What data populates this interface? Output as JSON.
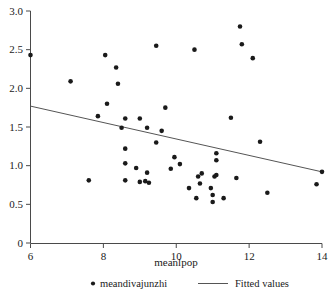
{
  "chart_data": {
    "type": "scatter",
    "title": "",
    "xlabel": "meanlpop",
    "ylabel": "",
    "xlim": [
      6,
      14
    ],
    "ylim": [
      0,
      3.0
    ],
    "grid": false,
    "xticks": [
      "6",
      "8",
      "10",
      "12",
      "14"
    ],
    "xtick_values": [
      6,
      8,
      10,
      12,
      14
    ],
    "yticks": [
      "0",
      "0.5",
      "1.0",
      "1.5",
      "2.0",
      "2.5",
      "3.0"
    ],
    "ytick_values": [
      0,
      0.5,
      1.0,
      1.5,
      2.0,
      2.5,
      3.0
    ],
    "legend_position": "below-axis",
    "series": [
      {
        "name": "meandivajunzhi",
        "type": "scatter",
        "marker": "circle",
        "color": "#1a1a1a",
        "points": [
          [
            6.0,
            2.43
          ],
          [
            7.1,
            2.09
          ],
          [
            7.6,
            0.81
          ],
          [
            7.85,
            1.64
          ],
          [
            8.05,
            2.43
          ],
          [
            8.1,
            1.8
          ],
          [
            8.35,
            2.27
          ],
          [
            8.4,
            2.06
          ],
          [
            8.5,
            1.49
          ],
          [
            8.6,
            1.61
          ],
          [
            8.6,
            1.22
          ],
          [
            8.6,
            1.03
          ],
          [
            8.6,
            0.81
          ],
          [
            8.9,
            0.97
          ],
          [
            9.0,
            1.61
          ],
          [
            9.0,
            0.79
          ],
          [
            9.15,
            0.8
          ],
          [
            9.2,
            1.49
          ],
          [
            9.2,
            0.91
          ],
          [
            9.25,
            0.78
          ],
          [
            9.45,
            2.55
          ],
          [
            9.45,
            1.3
          ],
          [
            9.6,
            1.45
          ],
          [
            9.7,
            1.75
          ],
          [
            9.85,
            0.96
          ],
          [
            9.95,
            1.11
          ],
          [
            10.1,
            1.02
          ],
          [
            10.35,
            0.71
          ],
          [
            10.5,
            2.5
          ],
          [
            10.55,
            0.58
          ],
          [
            10.6,
            0.86
          ],
          [
            10.65,
            0.77
          ],
          [
            10.7,
            0.9
          ],
          [
            10.95,
            0.71
          ],
          [
            11.0,
            0.62
          ],
          [
            11.0,
            0.53
          ],
          [
            11.05,
            0.86
          ],
          [
            11.1,
            1.16
          ],
          [
            11.1,
            1.07
          ],
          [
            11.1,
            0.88
          ],
          [
            11.3,
            0.58
          ],
          [
            11.5,
            1.62
          ],
          [
            11.65,
            0.84
          ],
          [
            11.75,
            2.8
          ],
          [
            11.8,
            2.57
          ],
          [
            12.1,
            2.39
          ],
          [
            12.3,
            1.31
          ],
          [
            12.5,
            0.65
          ],
          [
            13.85,
            0.76
          ],
          [
            14.0,
            0.92
          ]
        ]
      },
      {
        "name": "Fitted values",
        "type": "line",
        "color": "#555555",
        "endpoints": [
          [
            6.0,
            1.77
          ],
          [
            14.0,
            0.92
          ]
        ]
      }
    ]
  },
  "legend": {
    "items": [
      {
        "label": "meandivajunzhi",
        "marker": "dot"
      },
      {
        "label": "Fitted values",
        "marker": "line"
      }
    ]
  },
  "axes": {
    "x_title": "meanlpop"
  }
}
